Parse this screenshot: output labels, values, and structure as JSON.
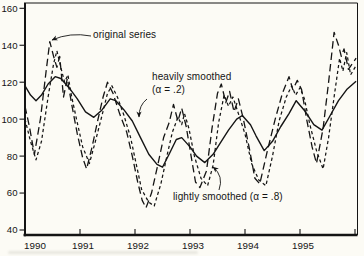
{
  "figure": {
    "background": "#fcfbf5",
    "ink": "#141414"
  },
  "chart_data": {
    "type": "line",
    "title": "",
    "xlabel": "",
    "ylabel": "",
    "grid": false,
    "legend_position": "none (inline annotations with arrows)",
    "xlim": [
      1990,
      1996.05
    ],
    "ylim": [
      40,
      160
    ],
    "x_tick_years": [
      1990,
      1991,
      1992,
      1993,
      1994,
      1995
    ],
    "x_tick_labels": [
      "1990",
      "1991",
      "1992",
      "1993",
      "1994",
      "1995"
    ],
    "x_minor_unlabeled_tick_year": 1996,
    "y_ticks": [
      160,
      140,
      120,
      100,
      80,
      60,
      40
    ],
    "y_tick_labels": [
      "160",
      "140",
      "120",
      "100",
      "80",
      "60",
      "40"
    ],
    "series": [
      {
        "name": "heavily smoothed (α = .2)",
        "style": "solid",
        "points": [
          [
            1990.0,
            118
          ],
          [
            1990.1,
            113
          ],
          [
            1990.2,
            110
          ],
          [
            1990.3,
            113
          ],
          [
            1990.42,
            119
          ],
          [
            1990.55,
            123
          ],
          [
            1990.65,
            122
          ],
          [
            1990.8,
            117
          ],
          [
            1990.95,
            111
          ],
          [
            1991.1,
            104
          ],
          [
            1991.25,
            101
          ],
          [
            1991.4,
            105
          ],
          [
            1991.55,
            111
          ],
          [
            1991.65,
            110
          ],
          [
            1991.8,
            105
          ],
          [
            1991.95,
            99
          ],
          [
            1992.1,
            90
          ],
          [
            1992.25,
            81
          ],
          [
            1992.4,
            75.5
          ],
          [
            1992.5,
            74
          ],
          [
            1992.62,
            81
          ],
          [
            1992.75,
            89
          ],
          [
            1992.85,
            90
          ],
          [
            1993.0,
            85
          ],
          [
            1993.12,
            80
          ],
          [
            1993.27,
            76.5
          ],
          [
            1993.42,
            81
          ],
          [
            1993.55,
            87
          ],
          [
            1993.7,
            94
          ],
          [
            1993.85,
            100
          ],
          [
            1993.95,
            102
          ],
          [
            1994.1,
            97
          ],
          [
            1994.2,
            91
          ],
          [
            1994.35,
            83
          ],
          [
            1994.5,
            88
          ],
          [
            1994.65,
            96
          ],
          [
            1994.8,
            103
          ],
          [
            1994.93,
            110
          ],
          [
            1995.1,
            104
          ],
          [
            1995.25,
            97
          ],
          [
            1995.4,
            94
          ],
          [
            1995.55,
            102
          ],
          [
            1995.7,
            110
          ],
          [
            1995.85,
            116
          ],
          [
            1996.02,
            120.5
          ]
        ]
      },
      {
        "name": "original series",
        "style": "long-dash",
        "points": [
          [
            1990.0,
            107
          ],
          [
            1990.08,
            96
          ],
          [
            1990.17,
            81
          ],
          [
            1990.28,
            100
          ],
          [
            1990.38,
            125
          ],
          [
            1990.45,
            142
          ],
          [
            1990.52,
            134
          ],
          [
            1990.58,
            128
          ],
          [
            1990.63,
            134
          ],
          [
            1990.7,
            112
          ],
          [
            1990.77,
            122
          ],
          [
            1990.85,
            108
          ],
          [
            1990.95,
            92
          ],
          [
            1991.05,
            79
          ],
          [
            1991.12,
            73
          ],
          [
            1991.22,
            85
          ],
          [
            1991.32,
            99
          ],
          [
            1991.42,
            112
          ],
          [
            1991.5,
            120
          ],
          [
            1991.6,
            114
          ],
          [
            1991.72,
            103
          ],
          [
            1991.85,
            93
          ],
          [
            1991.95,
            80
          ],
          [
            1992.05,
            66
          ],
          [
            1992.13,
            56
          ],
          [
            1992.2,
            52
          ],
          [
            1992.3,
            60
          ],
          [
            1992.42,
            76
          ],
          [
            1992.52,
            90
          ],
          [
            1992.62,
            98
          ],
          [
            1992.7,
            108
          ],
          [
            1992.78,
            99
          ],
          [
            1992.85,
            106
          ],
          [
            1992.93,
            96
          ],
          [
            1993.02,
            80
          ],
          [
            1993.1,
            66
          ],
          [
            1993.18,
            63
          ],
          [
            1993.3,
            72
          ],
          [
            1993.4,
            95
          ],
          [
            1993.5,
            114
          ],
          [
            1993.57,
            119
          ],
          [
            1993.65,
            109
          ],
          [
            1993.72,
            115
          ],
          [
            1993.8,
            104
          ],
          [
            1993.88,
            111
          ],
          [
            1993.97,
            100
          ],
          [
            1994.08,
            84
          ],
          [
            1994.18,
            68
          ],
          [
            1994.27,
            65
          ],
          [
            1994.4,
            82
          ],
          [
            1994.55,
            100
          ],
          [
            1994.68,
            114
          ],
          [
            1994.8,
            123
          ],
          [
            1994.87,
            116
          ],
          [
            1994.95,
            121
          ],
          [
            1995.03,
            116
          ],
          [
            1995.12,
            100
          ],
          [
            1995.22,
            85
          ],
          [
            1995.3,
            76
          ],
          [
            1995.42,
            95
          ],
          [
            1995.52,
            120
          ],
          [
            1995.62,
            147
          ],
          [
            1995.7,
            140
          ],
          [
            1995.75,
            134
          ],
          [
            1995.8,
            138
          ],
          [
            1995.88,
            127
          ],
          [
            1996.02,
            133
          ]
        ]
      },
      {
        "name": "lightly smoothed (α = .8)",
        "style": "short-dash",
        "points": [
          [
            1990.0,
            100
          ],
          [
            1990.1,
            88
          ],
          [
            1990.2,
            78
          ],
          [
            1990.3,
            88
          ],
          [
            1990.42,
            112
          ],
          [
            1990.52,
            130
          ],
          [
            1990.58,
            137
          ],
          [
            1990.65,
            128
          ],
          [
            1990.72,
            120
          ],
          [
            1990.78,
            124
          ],
          [
            1990.85,
            112
          ],
          [
            1990.95,
            98
          ],
          [
            1991.05,
            85
          ],
          [
            1991.17,
            76
          ],
          [
            1991.28,
            88
          ],
          [
            1991.4,
            102
          ],
          [
            1991.5,
            114
          ],
          [
            1991.58,
            118
          ],
          [
            1991.68,
            112
          ],
          [
            1991.8,
            102
          ],
          [
            1991.92,
            90
          ],
          [
            1992.02,
            76
          ],
          [
            1992.12,
            62
          ],
          [
            1992.25,
            55
          ],
          [
            1992.35,
            53
          ],
          [
            1992.47,
            65
          ],
          [
            1992.58,
            80
          ],
          [
            1992.68,
            93
          ],
          [
            1992.78,
            101
          ],
          [
            1992.85,
            97
          ],
          [
            1992.9,
            103
          ],
          [
            1992.98,
            95
          ],
          [
            1993.08,
            80
          ],
          [
            1993.2,
            68
          ],
          [
            1993.32,
            64
          ],
          [
            1993.42,
            75
          ],
          [
            1993.52,
            98
          ],
          [
            1993.62,
            113
          ],
          [
            1993.7,
            107
          ],
          [
            1993.78,
            112
          ],
          [
            1993.88,
            103
          ],
          [
            1994.0,
            92
          ],
          [
            1994.12,
            76
          ],
          [
            1994.25,
            67
          ],
          [
            1994.38,
            64
          ],
          [
            1994.5,
            80
          ],
          [
            1994.62,
            99
          ],
          [
            1994.75,
            112
          ],
          [
            1994.85,
            118
          ],
          [
            1994.92,
            113
          ],
          [
            1995.0,
            117
          ],
          [
            1995.08,
            111
          ],
          [
            1995.18,
            97
          ],
          [
            1995.3,
            83
          ],
          [
            1995.42,
            73
          ],
          [
            1995.52,
            90
          ],
          [
            1995.62,
            112
          ],
          [
            1995.72,
            133
          ],
          [
            1995.78,
            126
          ],
          [
            1995.85,
            136
          ],
          [
            1995.92,
            124
          ],
          [
            1996.02,
            129
          ]
        ]
      }
    ],
    "annotations": [
      {
        "id": "original-series",
        "lines": [
          "original series"
        ],
        "text_left": 93,
        "text_top": 29,
        "arrow": {
          "from": [
            91,
            36
          ],
          "ctrl": [
            70,
            32
          ],
          "to": [
            52,
            40
          ]
        }
      },
      {
        "id": "heavily-smoothed",
        "lines": [
          "heavily smoothed",
          "(α = .2)"
        ],
        "text_left": 152,
        "text_top": 71,
        "arrow": {
          "from": [
            147,
            99
          ],
          "ctrl": [
            139,
            105
          ],
          "to": [
            139,
            117
          ]
        }
      },
      {
        "id": "lightly-smoothed",
        "lines": [
          "lightly smoothed (α = .8)"
        ],
        "text_left": 173,
        "text_top": 191,
        "arrow": {
          "from": [
            219,
            190
          ],
          "ctrl": [
            224,
            176
          ],
          "to": [
            213,
            167
          ]
        }
      }
    ]
  }
}
